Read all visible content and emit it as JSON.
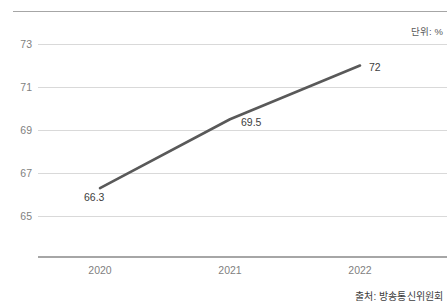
{
  "unit_note": "단위: %",
  "source_note": "출처: 방송통신위원회",
  "chart_data": {
    "type": "line",
    "title": "",
    "subtitle": "",
    "xlabel": "",
    "ylabel": "",
    "unit": "%",
    "categories": [
      "2020",
      "2021",
      "2022"
    ],
    "values": [
      66.3,
      69.5,
      72
    ],
    "data_labels": [
      "66.3",
      "69.5",
      "72"
    ],
    "series": [
      {
        "name": "",
        "values": [
          66.3,
          69.5,
          72
        ],
        "color": "#595959"
      }
    ],
    "ylim": [
      64,
      74
    ],
    "yticks": [
      73,
      71,
      69,
      67,
      65
    ],
    "ytick_labels": [
      "73",
      "71",
      "69",
      "67",
      "65"
    ],
    "grid": true,
    "grid_color": "#d9d9d9",
    "legend": "none",
    "axis_color": "#a6a6a6",
    "tick_label_color": "#7f7f7f"
  }
}
